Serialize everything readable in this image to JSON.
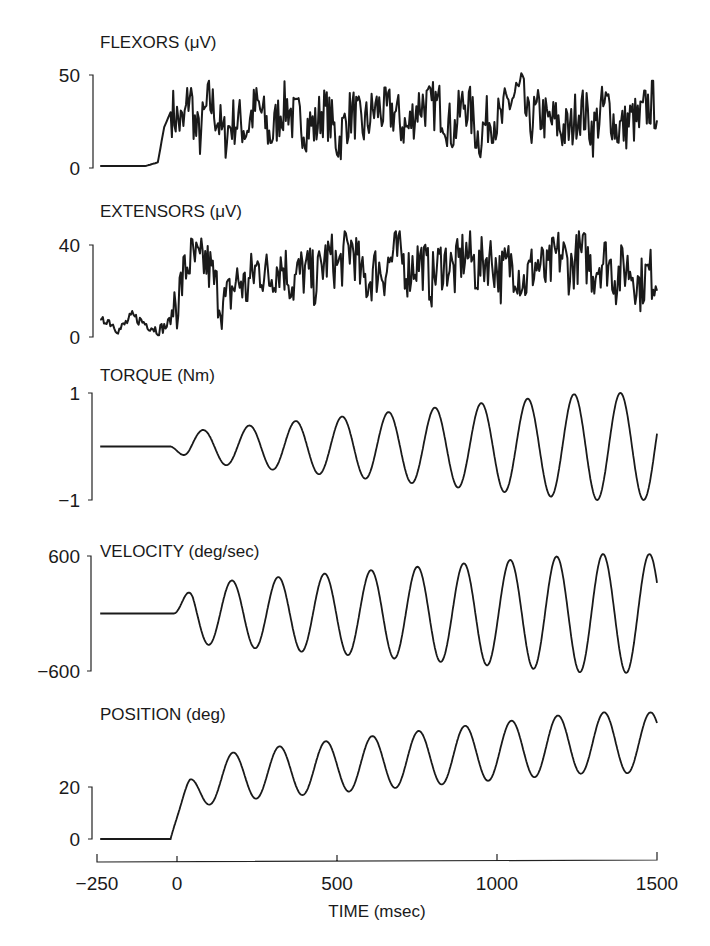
{
  "chart_data": {
    "type": "line",
    "title": "",
    "xlabel": "TIME (msec)",
    "xlim": [
      -250,
      1500
    ],
    "x_ticks": [
      -250,
      0,
      500,
      1000,
      1500
    ],
    "x_tick_labels": [
      "-250",
      "0",
      "500",
      "1000",
      "1500"
    ],
    "panels": [
      {
        "id": "flexors",
        "label": "FLEXORS (μV)",
        "y_ticks": [
          0,
          50
        ],
        "y_tick_labels": [
          "0",
          "50"
        ],
        "ylim": [
          0,
          50
        ],
        "kind": "emg",
        "baseline": 1,
        "onset_ms": -40,
        "description": "Flat near 0 before onset, then bursting EMG between ~5 and ~55 μV",
        "samples_ms": [
          -250,
          -100,
          -60,
          -40,
          -20,
          0,
          20,
          40,
          60,
          100,
          150,
          200,
          250,
          300,
          350,
          400,
          450,
          500,
          550,
          600,
          650,
          700,
          750,
          800,
          850,
          900,
          950,
          1000,
          1050,
          1080,
          1100,
          1150,
          1200,
          1250,
          1300,
          1350,
          1400,
          1450,
          1500
        ],
        "samples_uV": [
          1,
          1,
          3,
          22,
          30,
          33,
          12,
          45,
          10,
          35,
          12,
          18,
          30,
          12,
          38,
          10,
          30,
          8,
          25,
          20,
          38,
          15,
          30,
          42,
          15,
          35,
          10,
          25,
          38,
          55,
          15,
          30,
          8,
          28,
          20,
          32,
          10,
          30,
          33
        ]
      },
      {
        "id": "extensors",
        "label": "EXTENSORS (μV)",
        "y_ticks": [
          0,
          40
        ],
        "y_tick_labels": [
          "0",
          "40"
        ],
        "ylim": [
          0,
          40
        ],
        "kind": "emg",
        "baseline": 4,
        "onset_ms": -30,
        "description": "Low activity (~2-10 μV) before onset, then bursting EMG ~8-45 μV",
        "samples_ms": [
          -250,
          -220,
          -180,
          -140,
          -100,
          -60,
          -30,
          0,
          40,
          80,
          120,
          160,
          200,
          300,
          400,
          500,
          550,
          600,
          650,
          700,
          800,
          900,
          1000,
          1100,
          1200,
          1300,
          1400,
          1500
        ],
        "samples_uV": [
          4,
          8,
          3,
          9,
          6,
          3,
          5,
          14,
          35,
          43,
          15,
          8,
          22,
          33,
          25,
          40,
          45,
          20,
          38,
          40,
          30,
          40,
          35,
          28,
          40,
          38,
          30,
          22
        ]
      },
      {
        "id": "torque",
        "label": "TORQUE (Nm)",
        "y_ticks": [
          -1,
          1
        ],
        "y_tick_labels": [
          "-1",
          "1"
        ],
        "ylim": [
          -1,
          1
        ],
        "kind": "oscillation",
        "baseline": 0,
        "onset_ms": -20,
        "period_ms": 145,
        "amplitude_start": 0.25,
        "amplitude_end": 1.0,
        "phase_deg": 200,
        "description": "Zero until ~-20 ms, then ~7 Hz oscillation growing from ~0.3 to ~1 Nm"
      },
      {
        "id": "velocity",
        "label": "VELOCITY (deg/sec)",
        "y_ticks": [
          -600,
          600
        ],
        "y_tick_labels": [
          "-600",
          "600"
        ],
        "ylim": [
          -600,
          600
        ],
        "kind": "oscillation",
        "baseline": 0,
        "onset_ms": -10,
        "period_ms": 145,
        "amplitude_start": 300,
        "amplitude_end": 620,
        "phase_deg": 0,
        "description": "Zero until ~0 ms, then ~7 Hz oscillation growing from ~300 to ~620 deg/sec"
      },
      {
        "id": "position",
        "label": "POSITION (deg)",
        "y_ticks": [
          0,
          20
        ],
        "y_tick_labels": [
          "0",
          "20"
        ],
        "ylim": [
          0,
          20
        ],
        "kind": "position",
        "baseline": 0,
        "onset_ms": -20,
        "period_ms": 145,
        "offset_end": 37,
        "amplitude_start": 10,
        "amplitude_end": 13,
        "description": "0 deg until ~0 ms, rises to ~30 deg then oscillates at ~7 Hz with mean drifting upward to ~38 deg"
      }
    ],
    "grid": false,
    "legend": null
  },
  "axis": {
    "x_label": "TIME (msec)",
    "tick_labels": [
      "-250",
      "0",
      "500",
      "1000",
      "1500"
    ]
  }
}
